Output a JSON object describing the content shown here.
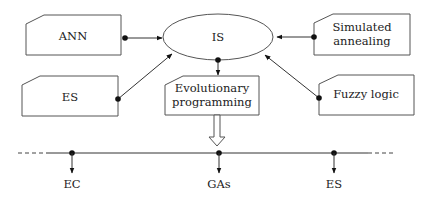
{
  "diagram": {
    "center": {
      "label": "IS"
    },
    "sources": [
      {
        "id": "ann",
        "label": [
          "ANN"
        ]
      },
      {
        "id": "es_top",
        "label": [
          "ES"
        ]
      },
      {
        "id": "sim",
        "label": [
          "Simulated",
          "annealing"
        ]
      },
      {
        "id": "fuzzy",
        "label": [
          "Fuzzy logic"
        ]
      }
    ],
    "output": {
      "label": [
        "Evolutionary",
        "programming"
      ]
    },
    "timeline": {
      "nodes": [
        {
          "label": "EC"
        },
        {
          "label": "GAs"
        },
        {
          "label": "ES"
        }
      ]
    }
  }
}
